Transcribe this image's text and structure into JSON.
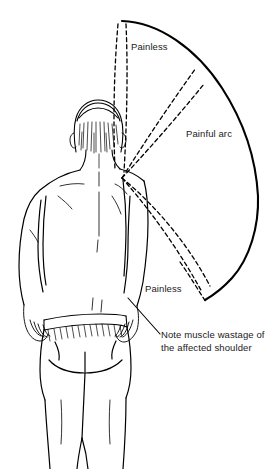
{
  "figure": {
    "background_color": "#ffffff",
    "ink_color": "#000000"
  },
  "labels": {
    "painless_top": "Painless",
    "painful_arc": "Painful arc",
    "painless_bottom": "Painless",
    "note_line1": "Note muscle wastage of",
    "note_line2": "the affected shoulder",
    "note_full": "Note muscle wastage of the affected shoulder"
  },
  "arc_diagram": {
    "pivot_x": 122,
    "pivot_y": 178,
    "arc_start": [
      122,
      21
    ],
    "arc_end": [
      205,
      300
    ],
    "arc_outer_right_x": 258,
    "zones": [
      {
        "name": "painless-upper",
        "style": "dashed",
        "label": "Painless"
      },
      {
        "name": "painful-arc",
        "style": "dashed",
        "label": "Painful arc"
      },
      {
        "name": "painless-lower",
        "style": "dashed",
        "label": "Painless"
      }
    ],
    "radial_lines": 5,
    "dash_pattern": "4 3"
  }
}
